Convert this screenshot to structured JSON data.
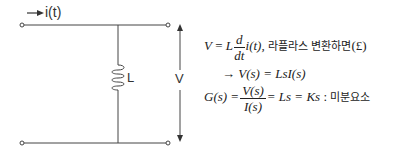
{
  "circuit": {
    "current_label": "i(t)",
    "inductor_label": "L",
    "voltage_label": "V"
  },
  "equations": {
    "line1": {
      "lhs": "V",
      "eq": "=",
      "L": "L",
      "num": "d",
      "den": "dt",
      "func": "i(t),",
      "korean": "라플라스 변환하면",
      "laplace": "(£)"
    },
    "line2": {
      "arrow": "→",
      "expr": "V(s) = LsI(s)"
    },
    "line3": {
      "lhs": "G(s) =",
      "num": "V(s)",
      "den": "I(s)",
      "rhs": "= Ls = Ks",
      "sep": ":",
      "korean": "미분요소"
    }
  }
}
